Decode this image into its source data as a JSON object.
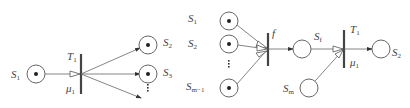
{
  "diagram": {
    "left_net": {
      "input_place": {
        "label": "S",
        "sub": "1",
        "token": true
      },
      "transition": {
        "label": "T",
        "sub": "1",
        "rate_label": "μ",
        "rate_sub": "1"
      },
      "output_places": [
        {
          "label": "S",
          "sub": "2",
          "token": true
        },
        {
          "label": "S",
          "sub": "3",
          "token": true
        },
        {
          "label": "S",
          "sub": "m",
          "token": true
        }
      ],
      "ellipsis": "⋮"
    },
    "right_net": {
      "input_places": [
        {
          "label": "S",
          "sub": "1",
          "token": true
        },
        {
          "label": "S",
          "sub": "2",
          "token": true
        },
        {
          "label": "S",
          "sub": "m−1",
          "token": true
        }
      ],
      "ellipsis": "⋮",
      "join_transition": {
        "label": "f"
      },
      "intermediate_place": {
        "label": "S",
        "sub": "f",
        "token": false
      },
      "extra_place": {
        "label": "S",
        "sub": "m",
        "token": false
      },
      "transition": {
        "label": "T",
        "sub": "1",
        "rate_label": "μ",
        "rate_sub": "1"
      },
      "output_place": {
        "label": "S",
        "sub": "2",
        "token": false
      }
    }
  }
}
